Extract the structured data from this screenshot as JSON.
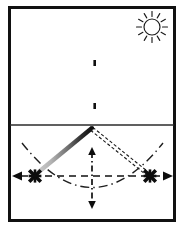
{
  "figure": {
    "width": 184,
    "height": 230,
    "background_color": "#ffffff"
  },
  "colors": {
    "ink": "#0d0d0d",
    "frame": "#111111",
    "horizon": "#2b2b2b",
    "arm_left_dark": "#1a1a1a",
    "arm_left_light": "#c9c9c9",
    "arm_right_outline": "#1a1a1a",
    "arc_dashdot": "#1f1f1f",
    "axis_dashed": "#111111",
    "sun": "#1a1a1a"
  },
  "frame": {
    "label": "outer border",
    "x": 8,
    "y": 6,
    "width": 168,
    "height": 216,
    "stroke_width": 3
  },
  "sun": {
    "label": "sun",
    "center_x": 152,
    "center_y": 27,
    "radius": 8,
    "ray_count": 12,
    "ray_inner": 10.5,
    "ray_outer": 15.5,
    "stroke_width": 1.1
  },
  "horizon": {
    "label": "horizon line",
    "y": 125,
    "x_start": 10,
    "x_end": 174,
    "stroke_width": 1.2
  },
  "mast": {
    "label": "vertical mast",
    "x": 92,
    "top_y": 29,
    "bottom_y": 128,
    "stroke_width": 3.4,
    "notches": [
      {
        "y": 63,
        "side": "right"
      },
      {
        "y": 105,
        "side": "right"
      }
    ]
  },
  "pivot": {
    "label": "pivot point",
    "x": 92,
    "y": 128
  },
  "arm_left": {
    "label": "left swing arm solid gradient",
    "from_x": 92,
    "from_y": 128,
    "to_x": 35,
    "to_y": 175,
    "stroke_width": 4.2,
    "style": "solid-gradient"
  },
  "arm_right": {
    "label": "right swing arm outlined dashed",
    "from_x": 92,
    "from_y": 128,
    "to_x": 150,
    "to_y": 175,
    "stroke_width": 4.0,
    "style": "double-dashed-outline"
  },
  "markers": [
    {
      "name": "left-endpoint-marker",
      "shape": "x-asterisk",
      "x": 35,
      "y": 176,
      "size": 7.5,
      "arrow_direction": "left",
      "arrow_tip_x": 13,
      "arrow_tail_x": 31
    },
    {
      "name": "right-endpoint-marker",
      "shape": "x-asterisk",
      "x": 150,
      "y": 176,
      "size": 7.5,
      "arrow_direction": "right",
      "arrow_tip_x": 172,
      "arrow_tail_x": 154
    }
  ],
  "horizontal_axis": {
    "label": "horizontal amplitude axis",
    "y": 176,
    "x_start": 20,
    "x_end": 165,
    "dash": "7 5",
    "stroke_width": 1.6,
    "double_headed": true
  },
  "vertical_axis": {
    "label": "vertical amplitude axis",
    "x": 92,
    "y_start": 148,
    "y_end": 208,
    "dash": "6 3 1.5 3",
    "stroke_width": 1.6,
    "double_headed": true
  },
  "swing_arc": {
    "label": "swing path arc",
    "style": "dash-dot",
    "dash": "9 4 1.5 4",
    "stroke_width": 1.4,
    "left_x": 22,
    "left_y": 143,
    "bottom_x": 92,
    "bottom_y": 203,
    "right_x": 163,
    "right_y": 143,
    "sweep_control_y": 232
  },
  "legend_note": {
    "visible_text": ""
  }
}
